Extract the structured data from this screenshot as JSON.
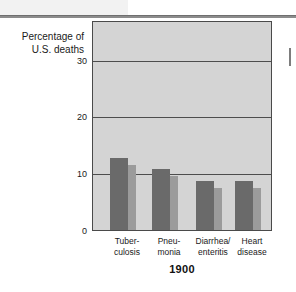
{
  "figure": {
    "y_axis_label": "Percentage of\nU.S. deaths",
    "x_axis_title": "1900"
  },
  "chart_data": {
    "type": "bar",
    "title": "",
    "subtitle": "",
    "xlabel": "1900",
    "ylabel": "Percentage of U.S. deaths",
    "categories": [
      "Tuber-\nculosis",
      "Pneu-\nmonia",
      "Diarrhea/\nenteritis",
      "Heart\ndisease"
    ],
    "values": [
      12.7,
      10.7,
      8.6,
      8.6
    ],
    "ylim": [
      0,
      37
    ],
    "yticks": [
      0,
      10,
      20,
      30
    ],
    "ytick_labels": [
      "0",
      "10",
      "20",
      "30"
    ],
    "grid": true,
    "gridlines_at": [
      10,
      20,
      30
    ],
    "legend": "none",
    "series": [
      {
        "name": "Percentage of U.S. deaths",
        "values": [
          12.7,
          10.7,
          8.6,
          8.6
        ]
      }
    ],
    "colors": {
      "bar_front": "#6a6a6a",
      "bar_side": "#9b9b9b",
      "plot_background": "#d4d4d4",
      "gridline": "#4d4d4d",
      "axis": "#4a4a4a",
      "text": "#1a1a1a"
    }
  }
}
